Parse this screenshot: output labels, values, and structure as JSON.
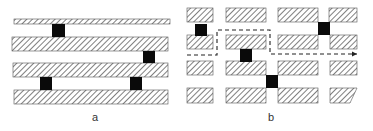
{
  "figure": {
    "panels": [
      {
        "id": "a",
        "label": "a",
        "description": "Continuous hatched horizontal strips connected by black square links",
        "strips": [
          {
            "x": 14,
            "y": 19,
            "w": 156,
            "h": 5
          },
          {
            "x": 12,
            "y": 37,
            "w": 156,
            "h": 14
          },
          {
            "x": 13,
            "y": 63,
            "w": 155,
            "h": 14
          },
          {
            "x": 14,
            "y": 90,
            "w": 154,
            "h": 14
          }
        ],
        "links": [
          {
            "x": 52,
            "y": 24,
            "w": 13,
            "h": 13
          },
          {
            "x": 143,
            "y": 51,
            "w": 12,
            "h": 12
          },
          {
            "x": 40,
            "y": 77,
            "w": 12,
            "h": 13
          },
          {
            "x": 130,
            "y": 77,
            "w": 12,
            "h": 13
          }
        ]
      },
      {
        "id": "b",
        "label": "b",
        "description": "Segmented hatched blocks in a grid with black square links and a dashed path",
        "blocks": [
          {
            "x": 187,
            "y": 8,
            "w": 26,
            "h": 14
          },
          {
            "x": 226,
            "y": 8,
            "w": 40,
            "h": 14
          },
          {
            "x": 278,
            "y": 8,
            "w": 40,
            "h": 14
          },
          {
            "x": 329,
            "y": 8,
            "w": 28,
            "h": 14
          },
          {
            "x": 187,
            "y": 35,
            "w": 26,
            "h": 14
          },
          {
            "x": 226,
            "y": 35,
            "w": 40,
            "h": 14
          },
          {
            "x": 278,
            "y": 35,
            "w": 40,
            "h": 14
          },
          {
            "x": 330,
            "y": 35,
            "w": 27,
            "h": 14
          },
          {
            "x": 187,
            "y": 61,
            "w": 26,
            "h": 14
          },
          {
            "x": 226,
            "y": 61,
            "w": 40,
            "h": 14
          },
          {
            "x": 278,
            "y": 61,
            "w": 40,
            "h": 14
          },
          {
            "x": 330,
            "y": 61,
            "w": 27,
            "h": 14
          },
          {
            "x": 187,
            "y": 88,
            "w": 26,
            "h": 15
          },
          {
            "x": 226,
            "y": 88,
            "w": 40,
            "h": 15
          },
          {
            "x": 278,
            "y": 88,
            "w": 40,
            "h": 15
          }
        ],
        "slanted_block": {
          "points": "330,88 357,88 350,103 330,103"
        },
        "links": [
          {
            "x": 195,
            "y": 24,
            "w": 12,
            "h": 12
          },
          {
            "x": 240,
            "y": 49,
            "w": 12,
            "h": 13
          },
          {
            "x": 318,
            "y": 22,
            "w": 12,
            "h": 13
          },
          {
            "x": 266,
            "y": 75,
            "w": 12,
            "h": 13
          }
        ],
        "dashed_path": "187,55 217,55 217,30 270,30 270,54 357,54",
        "arrow_tip": {
          "x": 357,
          "y": 54
        }
      }
    ],
    "colors": {
      "hatch": "#3a3a3a",
      "outline": "#555555",
      "link": "#0a0a0a",
      "background": "#ffffff"
    }
  }
}
